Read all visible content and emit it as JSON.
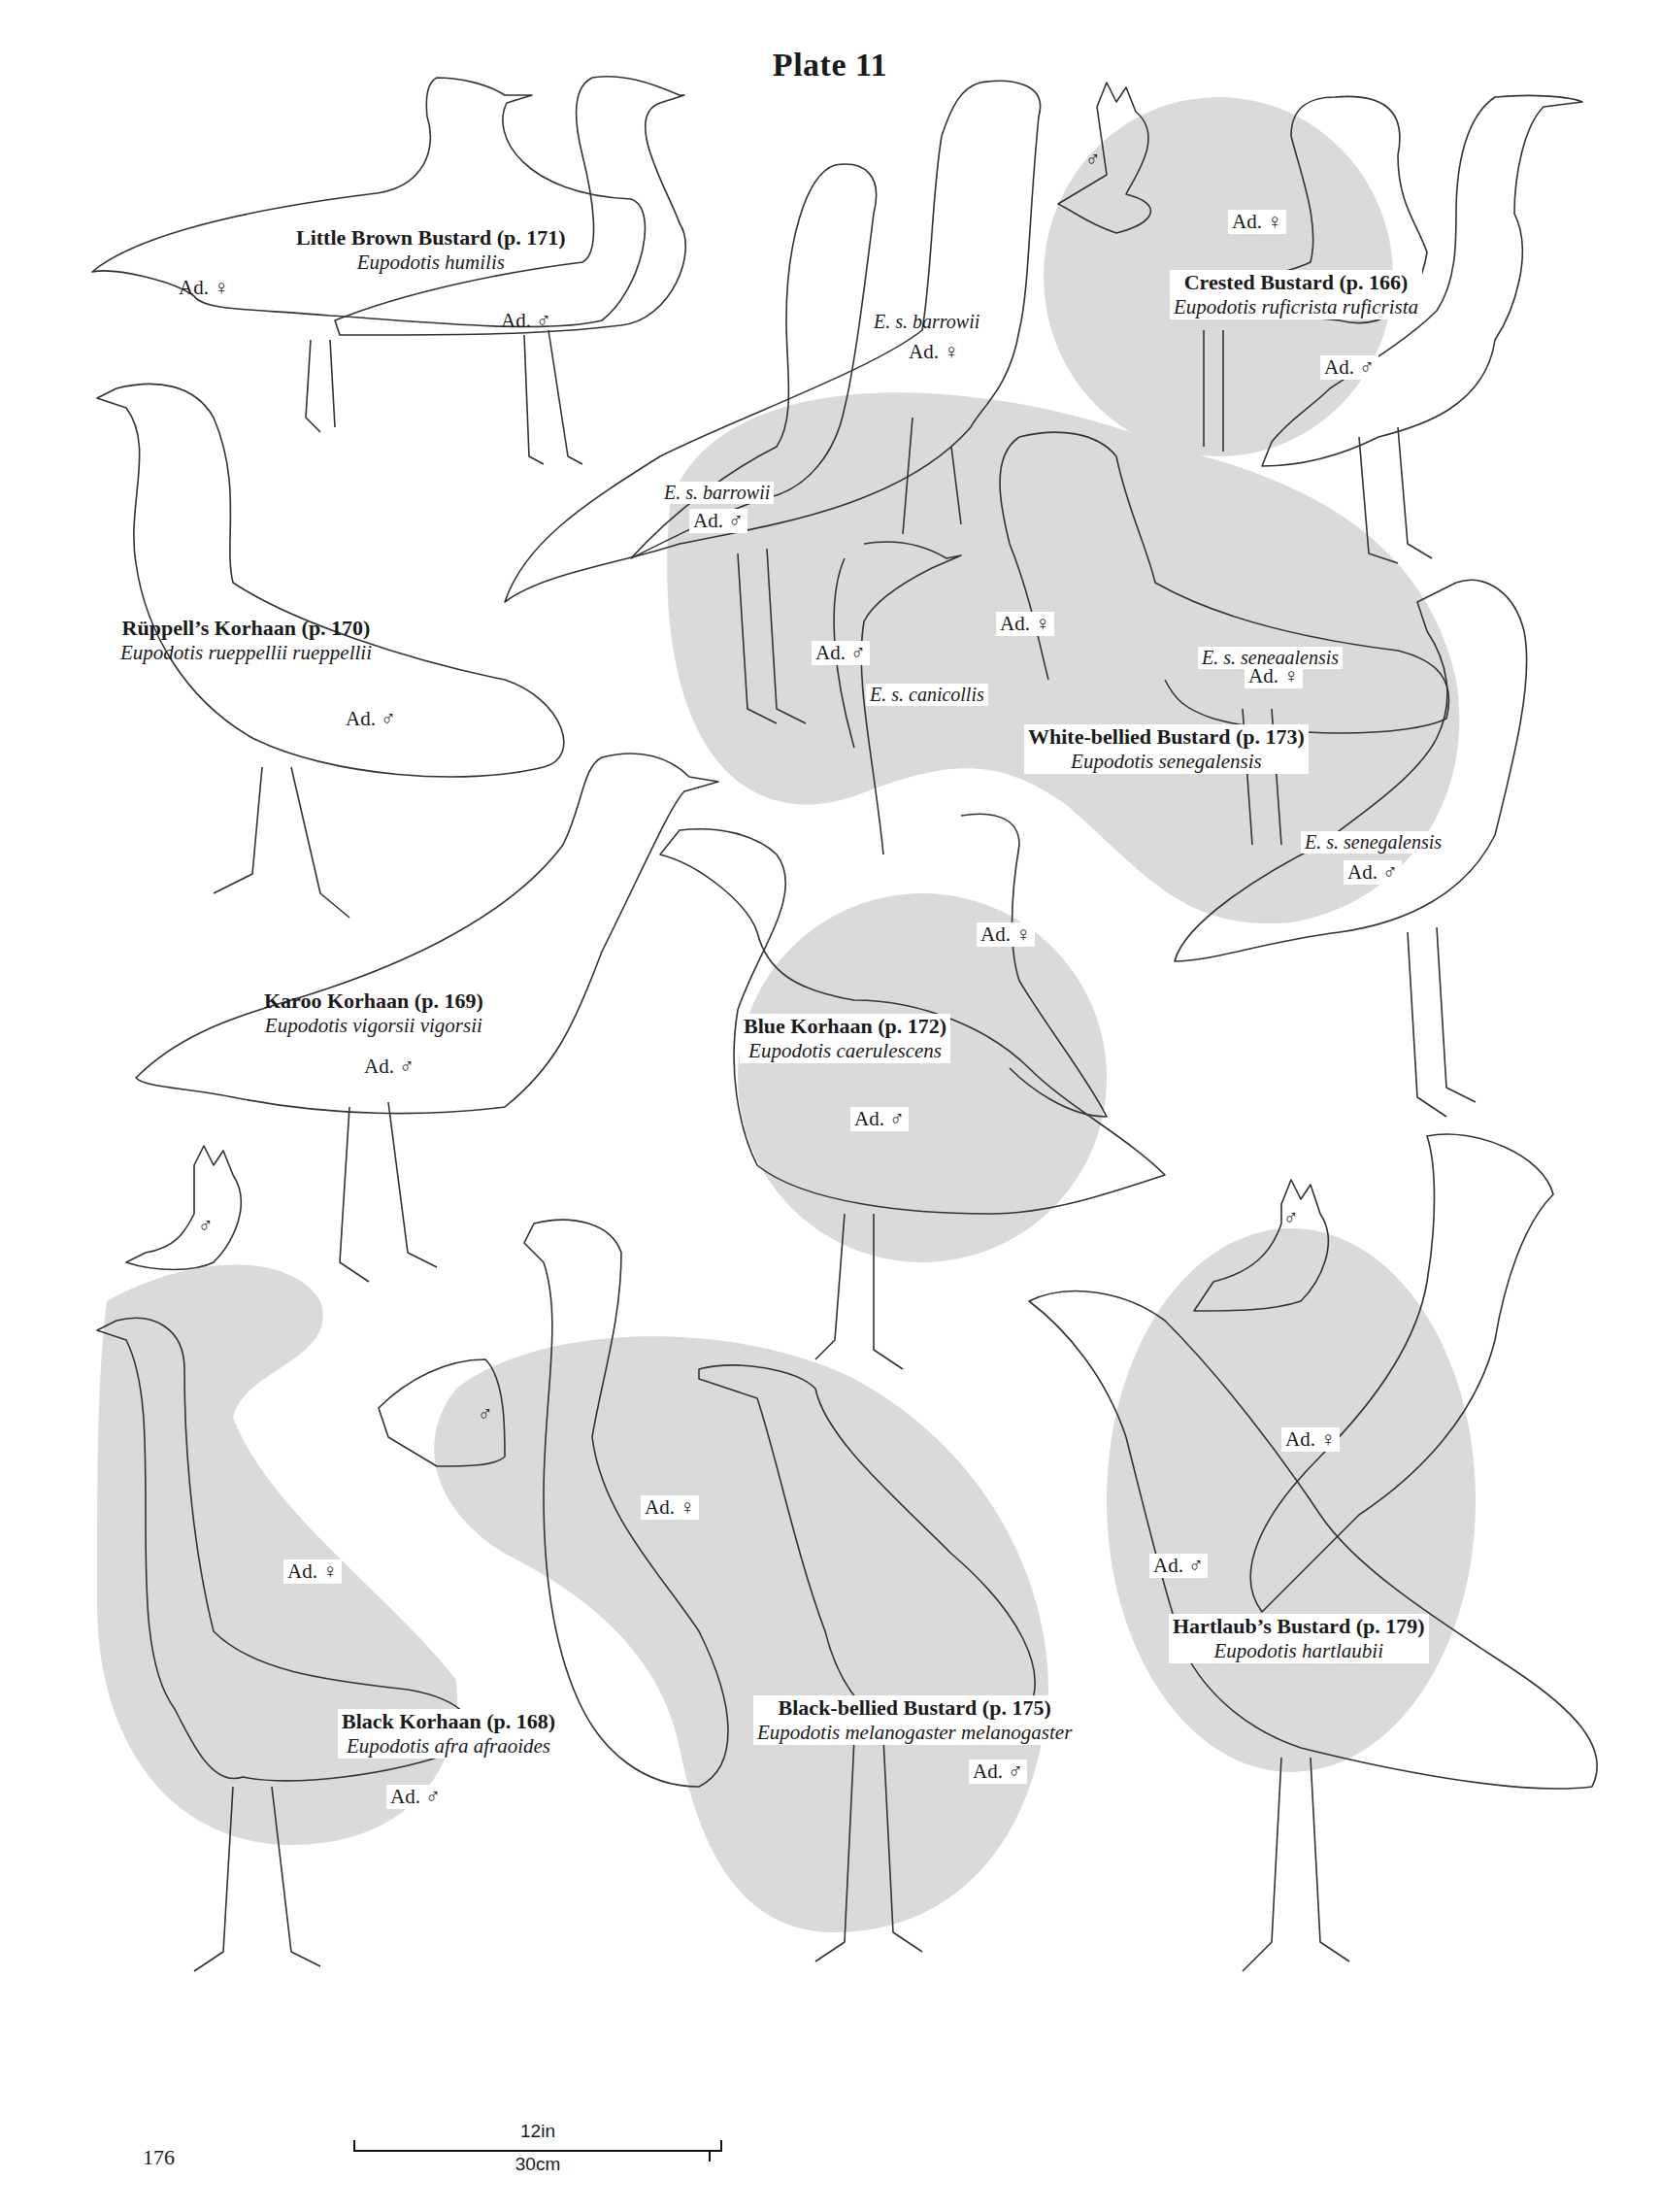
{
  "page": {
    "title": "Plate 11",
    "page_number": "176",
    "scale_bar": {
      "imperial": "12in",
      "metric": "30cm"
    }
  },
  "colors": {
    "shade": "#d9d9d9",
    "line": "#333333",
    "text": "#1a1a1a"
  },
  "species": [
    {
      "id": "little-brown-bustard",
      "name": "Little Brown Bustard (p. 171)",
      "scientific": "Eupodotis humilis",
      "tags": [
        {
          "text": "Ad. ♀"
        },
        {
          "text": "Ad. ♂"
        }
      ]
    },
    {
      "id": "crested-bustard",
      "name": "Crested Bustard (p. 166)",
      "scientific": "Eupodotis ruficrista ruficrista",
      "tags": [
        {
          "text": "♂"
        },
        {
          "text": "Ad. ♀"
        },
        {
          "text": "Ad. ♂"
        }
      ]
    },
    {
      "id": "ruppells-korhaan",
      "name": "Rüppell’s Korhaan (p. 170)",
      "scientific": "Eupodotis rueppellii rueppellii",
      "tags": [
        {
          "text": "Ad. ♂"
        }
      ]
    },
    {
      "id": "white-bellied-bustard",
      "name": "White-bellied Bustard (p. 173)",
      "scientific": "Eupodotis senegalensis",
      "subspecies": [
        {
          "name": "E. s. barrowii",
          "tag": "Ad. ♀"
        },
        {
          "name": "E. s. barrowii",
          "tag": "Ad. ♂"
        },
        {
          "name": "E. s. canicollis",
          "tag": "Ad. ♂"
        },
        {
          "name": "",
          "tag": "Ad. ♀"
        },
        {
          "name": "E. s. senegalensis",
          "tag": "Ad. ♀"
        },
        {
          "name": "E. s. senegalensis",
          "tag": "Ad. ♂"
        }
      ]
    },
    {
      "id": "karoo-korhaan",
      "name": "Karoo Korhaan (p. 169)",
      "scientific": "Eupodotis vigorsii vigorsii",
      "tags": [
        {
          "text": "Ad. ♂"
        }
      ]
    },
    {
      "id": "blue-korhaan",
      "name": "Blue Korhaan (p. 172)",
      "scientific": "Eupodotis caerulescens",
      "tags": [
        {
          "text": "Ad. ♀"
        },
        {
          "text": "Ad. ♂"
        }
      ]
    },
    {
      "id": "black-korhaan",
      "name": "Black Korhaan (p. 168)",
      "scientific": "Eupodotis afra afraoides",
      "tags": [
        {
          "text": "♂"
        },
        {
          "text": "Ad. ♀"
        },
        {
          "text": "Ad. ♂"
        }
      ]
    },
    {
      "id": "black-bellied-bustard",
      "name": "Black-bellied Bustard (p. 175)",
      "scientific": "Eupodotis melanogaster melanogaster",
      "tags": [
        {
          "text": "♂"
        },
        {
          "text": "Ad. ♀"
        },
        {
          "text": "Ad. ♂"
        }
      ]
    },
    {
      "id": "hartlaubs-bustard",
      "name": "Hartlaub’s Bustard (p. 179)",
      "scientific": "Eupodotis hartlaubii",
      "tags": [
        {
          "text": "♂"
        },
        {
          "text": "Ad. ♀"
        },
        {
          "text": "Ad. ♂"
        }
      ]
    }
  ]
}
